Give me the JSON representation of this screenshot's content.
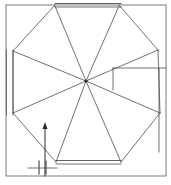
{
  "figure": {
    "title": "",
    "type": "line-drawing",
    "canvas": {
      "width": 171,
      "height": 185,
      "background": "#ffffff"
    },
    "stroke": {
      "color": "#4d4d4d",
      "accent_color": "#2b2b2b",
      "width": 0.8,
      "width_bold": 1.1
    },
    "geometry": {
      "hub": {
        "cx": 86,
        "cy": 81,
        "r": 1.6
      },
      "outer_frame": {
        "x": 6,
        "y": 5,
        "width": 160,
        "height": 171
      },
      "inner_left_line": {
        "x": 13,
        "y1": 50,
        "y2": 115
      },
      "right_panel": {
        "x1": 113,
        "y1": 68,
        "x2": 166,
        "y2": 152
      },
      "top_double_line": {
        "x1": 55,
        "x2": 121,
        "y1": 4,
        "y2": 8
      },
      "bottom_double_line": {
        "x1": 56,
        "x2": 121,
        "y1": 160,
        "y2": 164
      },
      "octagon_vertices": [
        {
          "name": "top-left",
          "x": 55,
          "y": 6
        },
        {
          "name": "top-right",
          "x": 119,
          "y": 6
        },
        {
          "name": "right-upper",
          "x": 158,
          "y": 50
        },
        {
          "name": "right-lower",
          "x": 160,
          "y": 113
        },
        {
          "name": "bottom-right",
          "x": 121,
          "y": 162
        },
        {
          "name": "bottom-left",
          "x": 56,
          "y": 162
        },
        {
          "name": "left-lower",
          "x": 13,
          "y": 113
        },
        {
          "name": "left-upper",
          "x": 13,
          "y": 51
        }
      ],
      "spokes_count": 8,
      "arrow": {
        "x": 45,
        "y_tail": 163,
        "y_head": 123,
        "head_width": 5,
        "head_length": 7
      },
      "break_ticks": [
        {
          "x": 39,
          "y1": 161,
          "y2": 174
        },
        {
          "x": 46,
          "y1": 161,
          "y2": 174
        }
      ],
      "tick_baseline": {
        "x1": 28,
        "x2": 57,
        "y": 168
      }
    }
  }
}
